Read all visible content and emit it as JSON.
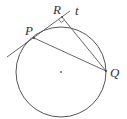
{
  "figure": {
    "type": "geometry-diagram",
    "colors": {
      "stroke": "#555555",
      "text": "#333333",
      "background": "#ffffff"
    },
    "circle": {
      "center": [
        61,
        72
      ],
      "radius": 45,
      "center_dot": true
    },
    "points": {
      "P": {
        "label": "P",
        "x": 34,
        "y": 38
      },
      "Q": {
        "label": "Q",
        "x": 106,
        "y": 71
      },
      "R": {
        "label": "R",
        "x": 62,
        "y": 17
      }
    },
    "lines": {
      "tangent": {
        "label": "t",
        "from": [
          7,
          57
        ],
        "to": [
          70,
          11
        ]
      },
      "chord_PQ": {
        "from": "P",
        "to": "Q"
      },
      "segment_RQ": {
        "from": "R",
        "to": "Q"
      }
    },
    "right_angle_at": "R",
    "labels": {
      "P": "P",
      "Q": "Q",
      "R": "R",
      "t": "t"
    }
  }
}
